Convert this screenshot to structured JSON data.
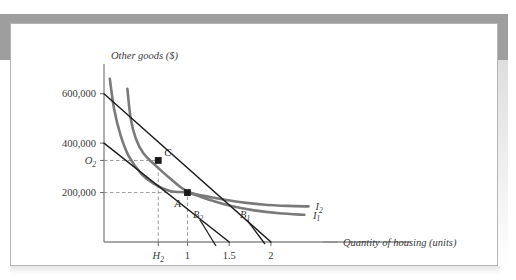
{
  "figure": {
    "background_color": "#ffffff",
    "card_border_color": "#b5b5b5",
    "shadow_color": "#9e9e9e"
  },
  "chart_data": {
    "type": "line",
    "title": "",
    "subtitle": "",
    "xlabel": "Quantity of housing (units)",
    "ylabel": "Other goods ($)",
    "xlim": [
      0,
      2.6
    ],
    "ylim": [
      0,
      700000
    ],
    "grid": false,
    "legend_position": "inline-right",
    "x_ticks": [
      {
        "label": "H",
        "sub": "2",
        "value": 0.65,
        "italic": true
      },
      {
        "label": "1",
        "sub": "",
        "value": 1.0,
        "italic": false
      },
      {
        "label": "1.5",
        "sub": "",
        "value": 1.5,
        "italic": false
      },
      {
        "label": "2",
        "sub": "",
        "value": 2.0,
        "italic": false
      }
    ],
    "y_ticks": [
      {
        "label": "600,000",
        "sub": "",
        "value": 600000,
        "italic": false
      },
      {
        "label": "400,000",
        "sub": "",
        "value": 400000,
        "italic": false
      },
      {
        "label": "O",
        "sub": "2",
        "value": 330000,
        "italic": true
      },
      {
        "label": "200,000",
        "sub": "",
        "value": 200000,
        "italic": false
      }
    ],
    "series": [
      {
        "name": "I1",
        "label": "I",
        "label_sub": "1",
        "kind": "indifference-curve",
        "color": "#7a7a7a",
        "width": 2.6,
        "points": [
          [
            0.07,
            660000
          ],
          [
            0.12,
            540000
          ],
          [
            0.2,
            430000
          ],
          [
            0.3,
            345000
          ],
          [
            0.45,
            275000
          ],
          [
            0.6,
            235000
          ],
          [
            0.8,
            205000
          ],
          [
            1.0,
            200000
          ],
          [
            1.25,
            172000
          ],
          [
            1.5,
            148000
          ],
          [
            1.8,
            128000
          ],
          [
            2.1,
            116000
          ],
          [
            2.4,
            110000
          ]
        ]
      },
      {
        "name": "I2",
        "label": "I",
        "label_sub": "2",
        "kind": "indifference-curve",
        "color": "#7a7a7a",
        "width": 2.6,
        "points": [
          [
            0.28,
            620000
          ],
          [
            0.32,
            500000
          ],
          [
            0.38,
            420000
          ],
          [
            0.47,
            360000
          ],
          [
            0.6,
            315000
          ],
          [
            0.8,
            255000
          ],
          [
            1.0,
            205000
          ],
          [
            1.3,
            180000
          ],
          [
            1.6,
            163000
          ],
          [
            1.9,
            152000
          ],
          [
            2.2,
            146000
          ],
          [
            2.45,
            144000
          ]
        ]
      },
      {
        "name": "B1",
        "label": "B",
        "label_sub": "1",
        "kind": "budget-line",
        "color": "#1e1e1e",
        "width": 1.5,
        "points": [
          [
            0.0,
            600000
          ],
          [
            2.0,
            0
          ]
        ]
      },
      {
        "name": "B2",
        "label": "B",
        "label_sub": "2",
        "kind": "budget-line",
        "color": "#1e1e1e",
        "width": 1.5,
        "points": [
          [
            0.0,
            400000
          ],
          [
            1.5,
            0
          ]
        ]
      }
    ],
    "points": [
      {
        "name": "C",
        "label": "C",
        "x": 0.65,
        "y": 330000,
        "marker": "square",
        "color": "#1a1a1a"
      },
      {
        "name": "A",
        "label": "A",
        "x": 1.0,
        "y": 200000,
        "marker": "square",
        "color": "#1a1a1a"
      }
    ],
    "guide_lines": [
      {
        "name": "guide-O2-horizontal",
        "from": [
          0,
          330000
        ],
        "to": [
          0.65,
          330000
        ],
        "style": "dashed"
      },
      {
        "name": "guide-H2-vertical",
        "from": [
          0.65,
          0
        ],
        "to": [
          0.65,
          330000
        ],
        "style": "dashed"
      },
      {
        "name": "guide-200k-horizontal",
        "from": [
          0,
          200000
        ],
        "to": [
          1.0,
          200000
        ],
        "style": "dashed"
      },
      {
        "name": "guide-1-vertical",
        "from": [
          1.0,
          0
        ],
        "to": [
          1.0,
          200000
        ],
        "style": "dashed"
      }
    ],
    "annotations": [
      {
        "name": "label-I2",
        "text": "I",
        "sub": "2"
      },
      {
        "name": "label-I1",
        "text": "I",
        "sub": "1"
      },
      {
        "name": "label-B2",
        "text": "B",
        "sub": "2"
      },
      {
        "name": "label-B1",
        "text": "B",
        "sub": "1"
      },
      {
        "name": "label-point-C",
        "text": "C"
      },
      {
        "name": "label-point-A",
        "text": "A"
      }
    ]
  }
}
